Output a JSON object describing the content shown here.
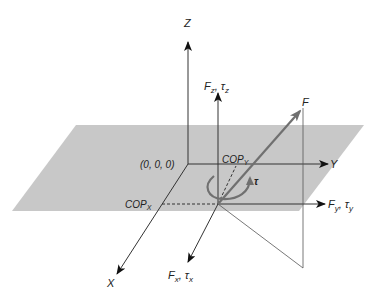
{
  "diagram": {
    "colors": {
      "plane": "#c8c8c8",
      "axis": "#333333",
      "force_vector": "#707070",
      "torque_arc": "#707070"
    },
    "labels": {
      "z_axis": "Z",
      "y_axis": "Y",
      "x_axis": "X",
      "origin": "(0, 0, 0)",
      "fz": "F",
      "fz_sub": "z",
      "tz": "τ",
      "tz_sub": "z",
      "fy": "F",
      "fy_sub": "y",
      "ty": "τ",
      "ty_sub": "y",
      "fx": "F",
      "fx_sub": "x",
      "tx": "τ",
      "tx_sub": "x",
      "f_resultant": "F",
      "torque": "τ",
      "cop_y": "COP",
      "cop_y_sub": "Y",
      "cop_x": "COP",
      "cop_x_sub": "X",
      "sep": ", "
    }
  }
}
